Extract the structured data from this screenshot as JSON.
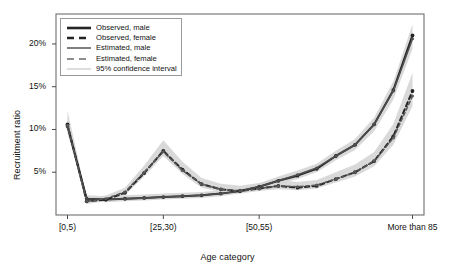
{
  "chart_data": {
    "type": "line",
    "title": "",
    "xlabel": "Age category",
    "ylabel": "Recruitment ratio",
    "x_tick_labels": [
      "[0,5)",
      "[25,30)",
      "[50,55)",
      "More than 85"
    ],
    "x_tick_indices": [
      0,
      5,
      10,
      18
    ],
    "y_tick_labels": [
      "5%",
      "10%",
      "15%",
      "20%"
    ],
    "y_tick_values": [
      5,
      10,
      15,
      20
    ],
    "ylim": [
      0,
      23.5
    ],
    "xlim": [
      -0.6,
      18.6
    ],
    "grid": false,
    "legend_position": "top-left-inside",
    "categories": [
      "[0,5)",
      "[5,10)",
      "[10,15)",
      "[15,20)",
      "[20,25)",
      "[25,30)",
      "[30,35)",
      "[35,40)",
      "[40,45)",
      "[45,50)",
      "[50,55)",
      "[55,60)",
      "[60,65)",
      "[65,70)",
      "[70,75)",
      "[75,80)",
      "[80,85)",
      "[85,90)",
      "More than 85"
    ],
    "series": [
      {
        "name": "Observed, male",
        "style": "solid",
        "color": "#242424",
        "values": [
          10.4,
          1.9,
          1.8,
          1.9,
          2.0,
          2.1,
          2.2,
          2.3,
          2.5,
          2.8,
          3.3,
          4.0,
          4.6,
          5.4,
          6.9,
          8.2,
          10.6,
          14.6,
          21.0
        ]
      },
      {
        "name": "Estimated, male",
        "style": "solid",
        "color": "#4f4f4f",
        "values": [
          10.3,
          1.9,
          1.8,
          1.9,
          2.0,
          2.1,
          2.2,
          2.3,
          2.5,
          2.8,
          3.3,
          4.0,
          4.7,
          5.5,
          6.9,
          8.2,
          10.6,
          14.5,
          20.6
        ]
      },
      {
        "name": "Observed, female",
        "style": "dashed",
        "color": "#242424",
        "values": [
          10.6,
          1.6,
          1.8,
          2.6,
          4.9,
          7.5,
          5.3,
          3.6,
          3.0,
          2.8,
          3.1,
          3.4,
          3.2,
          3.4,
          4.2,
          5.0,
          6.3,
          9.2,
          14.5
        ]
      },
      {
        "name": "Estimated, female",
        "style": "dashed",
        "color": "#585858",
        "values": [
          10.5,
          1.6,
          1.9,
          2.7,
          5.0,
          7.4,
          5.2,
          3.6,
          3.0,
          2.8,
          3.1,
          3.4,
          3.3,
          3.5,
          4.2,
          5.0,
          6.3,
          9.0,
          13.9
        ]
      }
    ],
    "confidence_interval": {
      "label": "95% confidence interval",
      "color": "#d7d7d7",
      "bands": [
        {
          "series": "male",
          "lower": [
            9.6,
            1.6,
            1.5,
            1.6,
            1.7,
            1.8,
            1.9,
            2.0,
            2.2,
            2.5,
            3.0,
            3.6,
            4.2,
            5.0,
            6.4,
            7.6,
            9.8,
            13.5,
            19.4
          ],
          "upper": [
            11.3,
            2.3,
            2.2,
            2.3,
            2.4,
            2.5,
            2.6,
            2.7,
            2.9,
            3.2,
            3.7,
            4.5,
            5.2,
            6.0,
            7.5,
            8.9,
            11.4,
            15.6,
            22.3
          ]
        },
        {
          "series": "female",
          "lower": [
            9.7,
            1.3,
            1.6,
            2.3,
            4.5,
            6.9,
            4.8,
            3.2,
            2.7,
            2.5,
            2.8,
            3.0,
            2.9,
            3.1,
            3.8,
            4.5,
            5.7,
            8.2,
            12.7
          ]
        }
      ]
    }
  },
  "legend": {
    "items": [
      {
        "label": "Observed, male",
        "key": "solid-thick-dark"
      },
      {
        "label": "Observed, female",
        "key": "dashed-thick-dark"
      },
      {
        "label": "Estimated, male",
        "key": "solid-medium-gray"
      },
      {
        "label": "Estimated, female",
        "key": "dashed-medium-gray"
      },
      {
        "label": "95% confidence interval",
        "key": "solid-thin-lightgray"
      }
    ]
  }
}
